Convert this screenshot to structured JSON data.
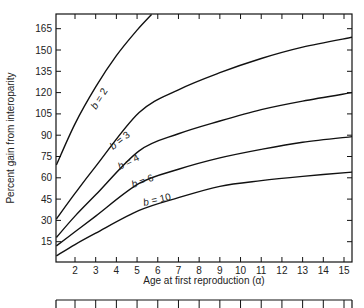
{
  "chart_data": {
    "type": "line",
    "title": "",
    "xlabel": "Age at first reproduction (α)",
    "ylabel": "Percent gain from iteroparity",
    "xlim": [
      1.1,
      15.4
    ],
    "ylim": [
      0,
      175
    ],
    "x_ticks": [
      2,
      3,
      4,
      5,
      6,
      7,
      8,
      9,
      10,
      11,
      12,
      13,
      14,
      15
    ],
    "y_ticks": [
      15,
      30,
      45,
      60,
      75,
      90,
      105,
      120,
      135,
      150,
      165
    ],
    "grid": false,
    "legend": "inline curve labels",
    "series": [
      {
        "name": "b = 2",
        "x": [
          1.1,
          2,
          3,
          4,
          5,
          5.7
        ],
        "values": [
          69,
          98,
          124,
          146,
          164,
          175
        ]
      },
      {
        "name": "b = 3",
        "x": [
          1.1,
          2,
          3,
          5.1,
          7,
          9,
          11,
          13,
          15.4
        ],
        "values": [
          31,
          49,
          68,
          106,
          122,
          134,
          144,
          152,
          159
        ]
      },
      {
        "name": "b = 4",
        "x": [
          1.1,
          2,
          3,
          5.1,
          7,
          9,
          11,
          13,
          15.4
        ],
        "values": [
          18,
          33,
          48,
          79,
          91,
          100,
          108,
          114,
          120
        ]
      },
      {
        "name": "b = 6",
        "x": [
          1.1,
          2,
          3,
          5.1,
          7,
          9,
          11,
          13,
          15.4
        ],
        "values": [
          12,
          22,
          33,
          56,
          66,
          74,
          80,
          85,
          89
        ]
      },
      {
        "name": "b = 10",
        "x": [
          1.1,
          2,
          3,
          5.1,
          7,
          9,
          11,
          13,
          15.4
        ],
        "values": [
          5,
          13,
          21,
          37,
          46,
          54,
          58,
          61,
          64
        ]
      }
    ],
    "annotations": [
      "b = 2",
      "b = 3",
      "b = 4",
      "b = 6",
      "b = 10"
    ]
  },
  "labels": {
    "xlabel": "Age at first reproduction (α)",
    "ylabel": "Percent gain from interoparity"
  }
}
